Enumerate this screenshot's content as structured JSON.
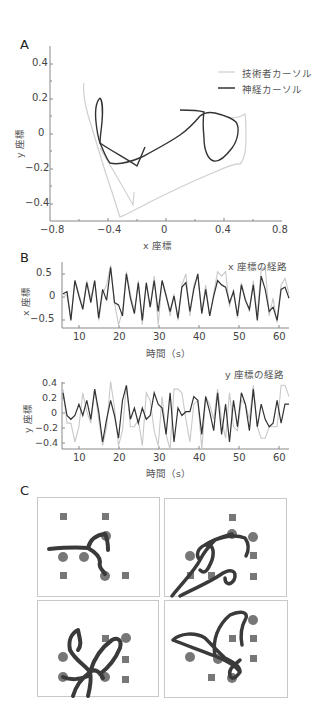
{
  "figure": {
    "panels": {
      "A": {
        "label": "A"
      },
      "B": {
        "label": "B"
      },
      "C": {
        "label": "C"
      }
    }
  },
  "chart_data": [
    {
      "id": "A",
      "type": "line",
      "title": "",
      "xlabel": "x 座標",
      "ylabel": "y 座標",
      "xlim": [
        -0.8,
        0.8
      ],
      "ylim": [
        -0.5,
        0.5
      ],
      "xticks": [
        "−0.8",
        "−0.4",
        "0",
        "0.4",
        "0.8"
      ],
      "yticks": [
        "0.4",
        "0.2",
        "0",
        "−0.2",
        "−0.4"
      ],
      "legend": [
        "技術者カーソル",
        "神経カーソル"
      ],
      "legend_position": "upper right",
      "grid": false,
      "series": [
        {
          "name": "技術者カーソル",
          "color": "#c8c8c8",
          "points": [
            [
              -0.56,
              0.29
            ],
            [
              -0.55,
              0.2
            ],
            [
              -0.52,
              0.1
            ],
            [
              -0.49,
              0.0
            ],
            [
              -0.45,
              -0.1
            ],
            [
              -0.4,
              -0.22
            ],
            [
              -0.35,
              -0.35
            ],
            [
              -0.3,
              -0.47
            ],
            [
              -0.2,
              -0.42
            ],
            [
              -0.05,
              -0.34
            ],
            [
              0.1,
              -0.27
            ],
            [
              0.25,
              -0.21
            ],
            [
              0.35,
              -0.17
            ],
            [
              0.45,
              -0.17
            ],
            [
              0.5,
              -0.15
            ],
            [
              0.53,
              -0.05
            ],
            [
              0.54,
              0.05
            ],
            [
              0.55,
              0.12
            ],
            [
              0.5,
              0.1
            ],
            [
              0.45,
              0.09
            ]
          ]
        },
        {
          "name": "神経カーソル",
          "color": "#333333",
          "points": [
            [
              -0.44,
              0.22
            ],
            [
              -0.47,
              0.15
            ],
            [
              -0.48,
              0.08
            ],
            [
              -0.46,
              0.0
            ],
            [
              -0.43,
              -0.09
            ],
            [
              -0.4,
              -0.17
            ],
            [
              -0.3,
              -0.17
            ],
            [
              -0.2,
              -0.15
            ],
            [
              -0.1,
              -0.12
            ],
            [
              0.0,
              -0.05
            ],
            [
              0.1,
              0.0
            ],
            [
              0.2,
              0.08
            ],
            [
              0.27,
              0.13
            ],
            [
              0.35,
              0.12
            ],
            [
              0.45,
              0.09
            ],
            [
              0.5,
              0.02
            ],
            [
              0.47,
              -0.06
            ],
            [
              0.4,
              -0.14
            ],
            [
              0.33,
              -0.16
            ],
            [
              0.28,
              -0.08
            ],
            [
              0.27,
              0.0
            ],
            [
              0.27,
              0.12
            ],
            [
              0.12,
              0.14
            ]
          ]
        }
      ]
    },
    {
      "id": "B-x",
      "type": "line",
      "title": "x 座標の経路",
      "xlabel": "時間（s）",
      "ylabel": "x 座標",
      "xlim": [
        6,
        63
      ],
      "ylim": [
        -0.65,
        0.75
      ],
      "xticks": [
        "10",
        "20",
        "30",
        "40",
        "50",
        "60"
      ],
      "yticks": [
        "0.5",
        "0",
        "−0.5"
      ],
      "grid": false,
      "series": [
        {
          "name": "技術者カーソル",
          "color": "#c8c8c8",
          "x": [
            6,
            7,
            8,
            9,
            10,
            11,
            12,
            13,
            14,
            15,
            16,
            17,
            18,
            19,
            20,
            21,
            22,
            23,
            24,
            25,
            26,
            27,
            28,
            29,
            30,
            31,
            32,
            33,
            34,
            35,
            36,
            37,
            38,
            39,
            40,
            41,
            42,
            43,
            44,
            45,
            46,
            47,
            48,
            49,
            50,
            51,
            52,
            53,
            54,
            55,
            56,
            57,
            58,
            59,
            60,
            61,
            62,
            63
          ],
          "values": [
            0.1,
            0.05,
            -0.45,
            0.4,
            0.1,
            -0.2,
            0.4,
            0.0,
            0.4,
            -0.5,
            0.1,
            0.3,
            0.75,
            -0.1,
            -0.6,
            -0.3,
            0.6,
            0.1,
            -0.3,
            0.4,
            -0.6,
            0.3,
            -0.2,
            0.5,
            -0.6,
            0.4,
            0.1,
            -0.4,
            0.1,
            -0.5,
            0.3,
            0.55,
            -0.4,
            0.3,
            0.5,
            -0.3,
            0.3,
            -0.4,
            0.1,
            0.6,
            0.5,
            0.6,
            -0.2,
            0.2,
            -0.45,
            0.35,
            0.0,
            -0.3,
            0.4,
            -0.4,
            0.65,
            0.7,
            -0.4,
            0.0,
            -0.55,
            0.3,
            0.45,
            0.1
          ]
        },
        {
          "name": "神経カーソル",
          "color": "#333333",
          "x": [
            6,
            7,
            8,
            9,
            10,
            11,
            12,
            13,
            14,
            15,
            16,
            17,
            18,
            19,
            20,
            21,
            22,
            23,
            24,
            25,
            26,
            27,
            28,
            29,
            30,
            31,
            32,
            33,
            34,
            35,
            36,
            37,
            38,
            39,
            40,
            41,
            42,
            43,
            44,
            45,
            46,
            47,
            48,
            49,
            50,
            51,
            52,
            53,
            54,
            55,
            56,
            57,
            58,
            59,
            60,
            61,
            62,
            63
          ],
          "values": [
            0.1,
            0.15,
            -0.5,
            0.4,
            0.05,
            -0.25,
            0.35,
            -0.1,
            0.4,
            -0.45,
            0.2,
            -0.05,
            0.7,
            -0.1,
            -0.15,
            -0.4,
            0.55,
            0.0,
            -0.35,
            0.35,
            -0.5,
            0.35,
            -0.2,
            0.4,
            -0.3,
            0.4,
            0.05,
            -0.3,
            0.05,
            -0.45,
            0.25,
            0.35,
            -0.3,
            0.2,
            0.55,
            -0.35,
            0.2,
            -0.4,
            0.05,
            0.4,
            0.3,
            0.25,
            -0.1,
            0.15,
            -0.4,
            0.3,
            -0.05,
            -0.25,
            0.3,
            -0.5,
            0.5,
            0.2,
            -0.3,
            -0.2,
            -0.5,
            0.2,
            0.25,
            0.0
          ]
        }
      ]
    },
    {
      "id": "B-y",
      "type": "line",
      "title": "y 座標の経路",
      "xlabel": "時間（s）",
      "ylabel": "y 座標",
      "xlim": [
        6,
        63
      ],
      "ylim": [
        -0.48,
        0.42
      ],
      "xticks": [
        "10",
        "20",
        "30",
        "40",
        "50",
        "60"
      ],
      "yticks": [
        "0.4",
        "0.2",
        "0",
        "−0.2",
        "−0.4"
      ],
      "grid": false,
      "series": [
        {
          "name": "技術者カーソル",
          "color": "#c8c8c8",
          "x": [
            6,
            7,
            8,
            9,
            10,
            11,
            12,
            13,
            14,
            15,
            16,
            17,
            18,
            19,
            20,
            21,
            22,
            23,
            24,
            25,
            26,
            27,
            28,
            29,
            30,
            31,
            32,
            33,
            34,
            35,
            36,
            37,
            38,
            39,
            40,
            41,
            42,
            43,
            44,
            45,
            46,
            47,
            48,
            49,
            50,
            51,
            52,
            53,
            54,
            55,
            56,
            57,
            58,
            59,
            60,
            61,
            62,
            63
          ],
          "values": [
            0.3,
            -0.15,
            -0.15,
            -0.4,
            -0.2,
            0.25,
            0.0,
            -0.15,
            0.3,
            -0.1,
            -0.45,
            -0.2,
            0.4,
            0.05,
            -0.45,
            -0.25,
            0.35,
            -0.2,
            -0.2,
            -0.1,
            -0.45,
            0.25,
            0.15,
            -0.25,
            -0.45,
            0.2,
            -0.3,
            -0.5,
            0.3,
            0.3,
            0.25,
            -0.1,
            -0.4,
            0.1,
            0.15,
            -0.5,
            0.2,
            0.1,
            -0.1,
            0.3,
            -0.1,
            -0.35,
            0.25,
            -0.2,
            -0.25,
            0.15,
            0.1,
            -0.1,
            0.35,
            -0.2,
            -0.35,
            -0.35,
            -0.2,
            -0.2,
            -0.2,
            0.35,
            0.35,
            0.2
          ]
        },
        {
          "name": "神経カーソル",
          "color": "#333333",
          "x": [
            6,
            7,
            8,
            9,
            10,
            11,
            12,
            13,
            14,
            15,
            16,
            17,
            18,
            19,
            20,
            21,
            22,
            23,
            24,
            25,
            26,
            27,
            28,
            29,
            30,
            31,
            32,
            33,
            34,
            35,
            36,
            37,
            38,
            39,
            40,
            41,
            42,
            43,
            44,
            45,
            46,
            47,
            48,
            49,
            50,
            51,
            52,
            53,
            54,
            55,
            56,
            57,
            58,
            59,
            60,
            61,
            62,
            63
          ],
          "values": [
            0.25,
            -0.05,
            -0.1,
            -0.05,
            0.1,
            -0.05,
            0.15,
            -0.1,
            0.3,
            0.0,
            -0.4,
            -0.1,
            0.15,
            -0.05,
            -0.35,
            0.15,
            0.35,
            -0.1,
            0.05,
            -0.15,
            0.05,
            -0.1,
            -0.05,
            0.25,
            0.1,
            0.05,
            -0.3,
            0.25,
            -0.4,
            0.05,
            -0.05,
            0.0,
            0.0,
            0.2,
            0.15,
            -0.3,
            0.2,
            0.0,
            -0.25,
            0.25,
            -0.3,
            0.1,
            -0.4,
            0.15,
            -0.2,
            0.25,
            0.1,
            -0.25,
            0.3,
            -0.2,
            0.1,
            -0.1,
            -0.2,
            -0.15,
            0.15,
            -0.15,
            0.1,
            0.1
          ]
        }
      ]
    }
  ],
  "panel_c": {
    "description": "4 workspace snapshots with square targets and circular targets and thick cursor trajectories",
    "target_color": "#777777",
    "trace_color": "#3a3a3a",
    "boxes": 4
  },
  "legend": {
    "technician": "技術者カーソル",
    "neural": "神経カーソル"
  }
}
